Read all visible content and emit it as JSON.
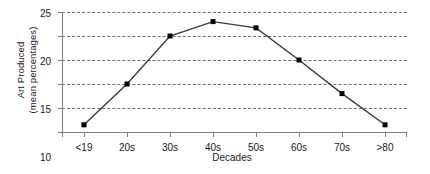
{
  "chart_data": {
    "type": "line",
    "title": "",
    "xlabel": "Decades",
    "ylabel": "Art Produced (mean percentages)",
    "ylabel_line1": "Art Produced",
    "ylabel_line2": "(mean percentages)",
    "categories": [
      "<19",
      "20s",
      "30s",
      "40s",
      "50s",
      "60s",
      "70s",
      ">80"
    ],
    "values": [
      1.5,
      10,
      20,
      23,
      21.7,
      15,
      8,
      1.5
    ],
    "series": [
      {
        "name": "Art Produced",
        "values": [
          1.5,
          10,
          20,
          23,
          21.7,
          15,
          8,
          1.5
        ]
      }
    ],
    "ylim": [
      0,
      25
    ],
    "yticks": [
      0,
      5,
      10,
      15,
      20,
      25
    ],
    "ytick_labels": [
      "0",
      "5",
      "10",
      "15",
      "20",
      "25"
    ],
    "grid": true,
    "grid_axis": "y",
    "grid_style": "dashed",
    "legend": false,
    "legend_position": "none",
    "marker": "square",
    "marker_color": "#000000",
    "line_color": "#3b3b3b",
    "axis_color": "#7d7d7d",
    "grid_color": "#6f6f6f",
    "background_color": "#ffffff"
  }
}
